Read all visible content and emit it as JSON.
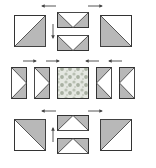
{
  "diagram": {
    "colors": {
      "background": "#ffffff",
      "stroke": "#333333",
      "shade": "#b8b8b8",
      "light": "#ffffff",
      "arrow": "#444444",
      "center_fabric": "#c9cfc4"
    },
    "rows": [
      {
        "name": "top-row",
        "pieces": [
          {
            "type": "half-square-triangle",
            "shaded": "lower-right"
          },
          {
            "type": "flying-geese-pair",
            "point": "down"
          },
          {
            "type": "half-square-triangle",
            "shaded": "lower-left"
          }
        ],
        "arrows": [
          "left",
          "right",
          "down"
        ]
      },
      {
        "name": "middle-row",
        "pieces": [
          {
            "type": "flying-goose",
            "point": "right"
          },
          {
            "type": "flying-goose",
            "point": "right"
          },
          {
            "type": "center-square",
            "fabric": "floral print"
          },
          {
            "type": "flying-goose",
            "point": "left"
          },
          {
            "type": "flying-goose",
            "point": "left"
          }
        ],
        "arrows": [
          "right",
          "right",
          "left",
          "left"
        ]
      },
      {
        "name": "bottom-row",
        "pieces": [
          {
            "type": "half-square-triangle",
            "shaded": "upper-right"
          },
          {
            "type": "flying-geese-pair",
            "point": "up"
          },
          {
            "type": "half-square-triangle",
            "shaded": "upper-left"
          }
        ],
        "arrows": [
          "left",
          "right",
          "up"
        ]
      }
    ]
  }
}
